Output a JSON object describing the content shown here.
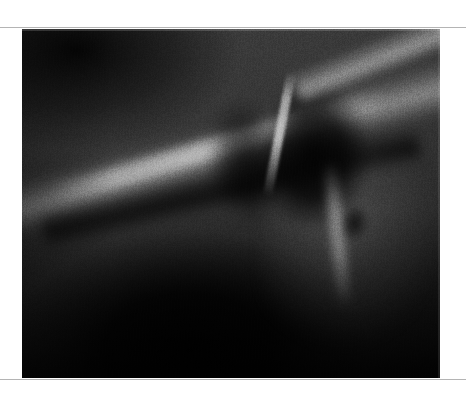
{
  "page": {
    "background_color": "#ffffff",
    "width": 466,
    "height": 400
  },
  "rules": {
    "color": "#b4b4b4",
    "top_y": 27,
    "bottom_y": 379
  },
  "figure": {
    "kind": "radiograph",
    "modality": "x-ray",
    "color_mode": "grayscale",
    "caption": "",
    "label": "",
    "x": 22,
    "y": 29,
    "width": 418,
    "height": 349,
    "background_color": "#0a0a0a",
    "tone": {
      "darkest": "#000000",
      "mid": "#343434",
      "brightest": "#f0f0f0"
    },
    "features": [
      {
        "name": "bright-diagonal-ridge",
        "description": "broad bright oblique band running from lower-left to upper-right",
        "brightness": "bright"
      },
      {
        "name": "dark-band-under-ridge",
        "description": "radiolucent dark band immediately beneath the bright ridge",
        "brightness": "dark"
      },
      {
        "name": "central-dark-mass",
        "description": "V-shaped dark radiolucent region in the upper-right-of-center",
        "brightness": "very dark"
      },
      {
        "name": "bright-streak",
        "description": "thin bright near-vertical line crossing the central dark mass",
        "brightness": "bright"
      },
      {
        "name": "upper-right-cortical-edge",
        "description": "bright oblique border along the top-right corner",
        "brightness": "bright"
      },
      {
        "name": "right-vertical-edge",
        "description": "bright near-vertical cortical line on the right side",
        "brightness": "bright"
      },
      {
        "name": "focal-dark-lesion",
        "description": "small dark focal area on the right side, mid-height",
        "brightness": "dark"
      },
      {
        "name": "lower-left-dark-zone",
        "description": "large underexposed very dark region occupying the lower-left and lower-center",
        "brightness": "very dark"
      }
    ]
  }
}
